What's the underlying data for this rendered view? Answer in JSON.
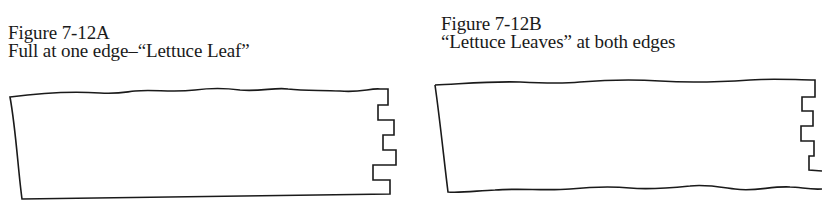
{
  "figures": [
    {
      "id": "7-12A",
      "title": "Figure 7-12A",
      "subtitle": "Full at one edge–“Lettuce Leaf”"
    },
    {
      "id": "7-12B",
      "title": "Figure 7-12B",
      "subtitle": "“Lettuce Leaves” at both edges"
    }
  ],
  "colors": {
    "ink": "#1a1a1a",
    "paper": "#ffffff"
  }
}
